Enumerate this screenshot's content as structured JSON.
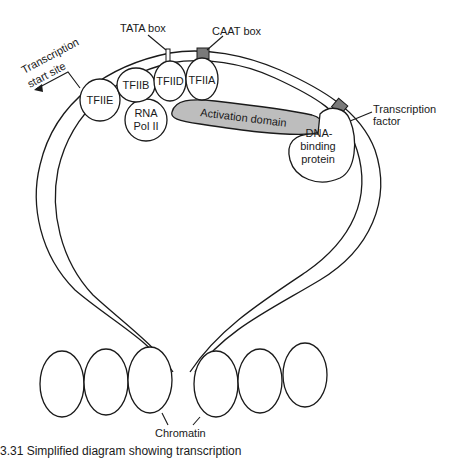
{
  "diagram": {
    "labels": {
      "tata_box": "TATA box",
      "caat_box": "CAAT box",
      "transcription_start_site_line1": "Transcription",
      "transcription_start_site_line2": "start site",
      "tfiie": "TFIIE",
      "tfiib": "TFIIB",
      "tfiid": "TFIID",
      "tfiia": "TFIIA",
      "rna_pol_line1": "RNA",
      "rna_pol_line2": "Pol II",
      "activation_domain": "Activation domain",
      "dna_binding_line1": "DNA-",
      "dna_binding_line2": "binding",
      "dna_binding_line3": "protein",
      "transcription_factor_line1": "Transcription",
      "transcription_factor_line2": "factor",
      "chromatin": "Chromatin"
    },
    "colors": {
      "box_fill": "#7a7a7a",
      "activation_domain_fill": "#bdbdbd",
      "stroke": "#1a1a1a"
    }
  },
  "caption": {
    "text": "3.31   Simplified diagram showing transcription"
  }
}
